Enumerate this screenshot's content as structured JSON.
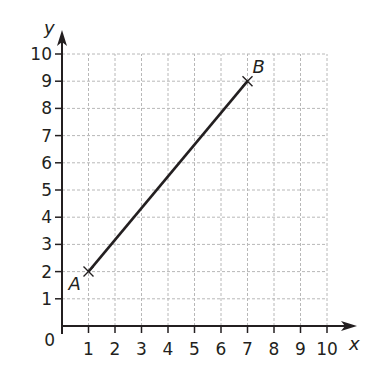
{
  "chart_data": {
    "type": "line",
    "title": "",
    "xlabel": "x",
    "ylabel": "y",
    "xlim": [
      0,
      10
    ],
    "ylim": [
      0,
      10
    ],
    "grid": true,
    "grid_style": "dashed",
    "origin_label": "0",
    "x_ticks": [
      "1",
      "2",
      "3",
      "4",
      "5",
      "6",
      "7",
      "8",
      "9",
      "10"
    ],
    "y_ticks": [
      "1",
      "2",
      "3",
      "4",
      "5",
      "6",
      "7",
      "8",
      "9",
      "10"
    ],
    "points": [
      {
        "label": "A",
        "x": 1,
        "y": 2
      },
      {
        "label": "B",
        "x": 7,
        "y": 9
      }
    ],
    "series": [
      {
        "name": "segment AB",
        "x": [
          1,
          7
        ],
        "y": [
          2,
          9
        ]
      }
    ],
    "colors": {
      "axis": "#231f20",
      "grid": "#b8b8b8",
      "line": "#231f20"
    }
  }
}
